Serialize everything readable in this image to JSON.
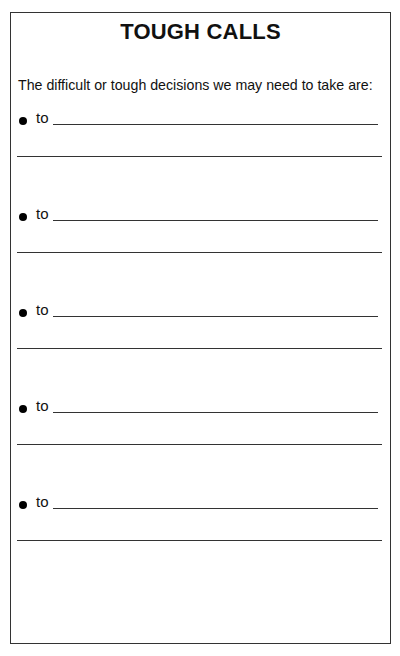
{
  "worksheet": {
    "title": "TOUGH CALLS",
    "intro": "The difficult or tough decisions we may need to take are:",
    "items": [
      {
        "prefix": "to",
        "line1": "",
        "line2": ""
      },
      {
        "prefix": "to",
        "line1": "",
        "line2": ""
      },
      {
        "prefix": "to",
        "line1": "",
        "line2": ""
      },
      {
        "prefix": "to",
        "line1": "",
        "line2": ""
      },
      {
        "prefix": "to",
        "line1": "",
        "line2": ""
      }
    ]
  }
}
